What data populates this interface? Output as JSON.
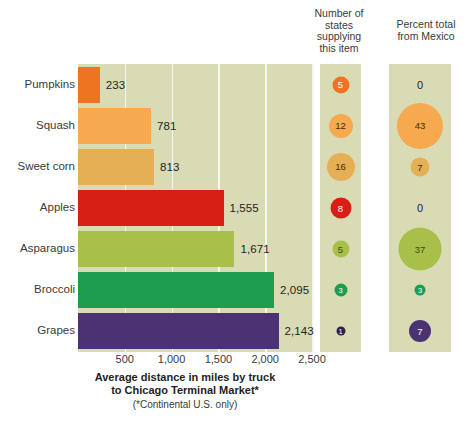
{
  "headers": {
    "states": "Number of\nstates\nsupplying\nthis item",
    "mexico": "Percent total\nfrom Mexico"
  },
  "caption": {
    "line1": "Average distance in miles by truck",
    "line2": "to Chicago Terminal Market*",
    "footnote": "(*Continental U.S. only)"
  },
  "axis": {
    "ticks": [
      "500",
      "1,000",
      "1,500",
      "2,000",
      "2,500"
    ],
    "max": 2500
  },
  "colors": {
    "plot_bg": "#d8dbb4",
    "gridline": "#f6f7ef",
    "page_bg": "#ffffff"
  },
  "chart_data": {
    "type": "bar",
    "title": "Average distance in miles by truck to Chicago Terminal Market*",
    "xlabel": "Average distance in miles by truck to Chicago Terminal Market*",
    "ylabel": "",
    "xlim": [
      0,
      2500
    ],
    "grid": true,
    "orientation": "horizontal",
    "categories": [
      "Pumpkins",
      "Squash",
      "Sweet corn",
      "Apples",
      "Asparagus",
      "Broccoli",
      "Grapes"
    ],
    "values": [
      233,
      781,
      813,
      1555,
      1671,
      2095,
      2143
    ],
    "value_labels": [
      "233",
      "781",
      "813",
      "1,555",
      "1,671",
      "2,095",
      "2,143"
    ],
    "bar_colors": [
      "#ee7422",
      "#f7a94f",
      "#e5b055",
      "#d81f16",
      "#a8c04a",
      "#1f9d4e",
      "#4b3272"
    ],
    "series": [
      {
        "name": "Number of states supplying this item",
        "type": "bubble",
        "values": [
          5,
          12,
          16,
          8,
          5,
          3,
          1
        ],
        "labels": [
          "5",
          "12",
          "16",
          "8",
          "5",
          "3",
          "1"
        ],
        "diameters": [
          17,
          24,
          28,
          21,
          17,
          13,
          9
        ],
        "colors": [
          "#ee7422",
          "#f7a94f",
          "#e5b055",
          "#d81f16",
          "#a8c04a",
          "#1f9d4e",
          "#2e2150"
        ],
        "text_colors": [
          "#ffffff",
          "#3a2a10",
          "#3a2a10",
          "#ffffff",
          "#3a4a18",
          "#ffffff",
          "#ffffff"
        ]
      },
      {
        "name": "Percent total from Mexico",
        "type": "bubble",
        "values": [
          0,
          43,
          7,
          0,
          37,
          3,
          7
        ],
        "labels": [
          "0",
          "43",
          "7",
          "0",
          "37",
          "3",
          "7"
        ],
        "diameters": [
          0,
          46,
          19,
          0,
          43,
          11,
          22
        ],
        "colors": [
          "none",
          "#f7a94f",
          "#e5b055",
          "none",
          "#a8c04a",
          "#1f9d4e",
          "#4b3272"
        ],
        "text_colors": [
          "#23231f",
          "#3a2a10",
          "#3a2a10",
          "#23231f",
          "#3a4a18",
          "#ffffff",
          "#ffffff"
        ]
      }
    ]
  }
}
